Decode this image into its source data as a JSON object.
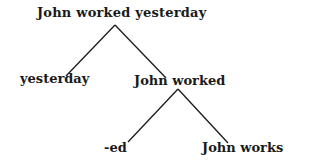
{
  "diagram": {
    "type": "tree",
    "nodes": {
      "root": "John worked yesterday",
      "left_child": "yesterday",
      "right_child": "John worked",
      "right_left_child": "-ed",
      "right_right_child": "John works"
    },
    "edges": [
      [
        "John worked yesterday",
        "yesterday"
      ],
      [
        "John worked yesterday",
        "John worked"
      ],
      [
        "John worked",
        "-ed"
      ],
      [
        "John worked",
        "John works"
      ]
    ]
  }
}
